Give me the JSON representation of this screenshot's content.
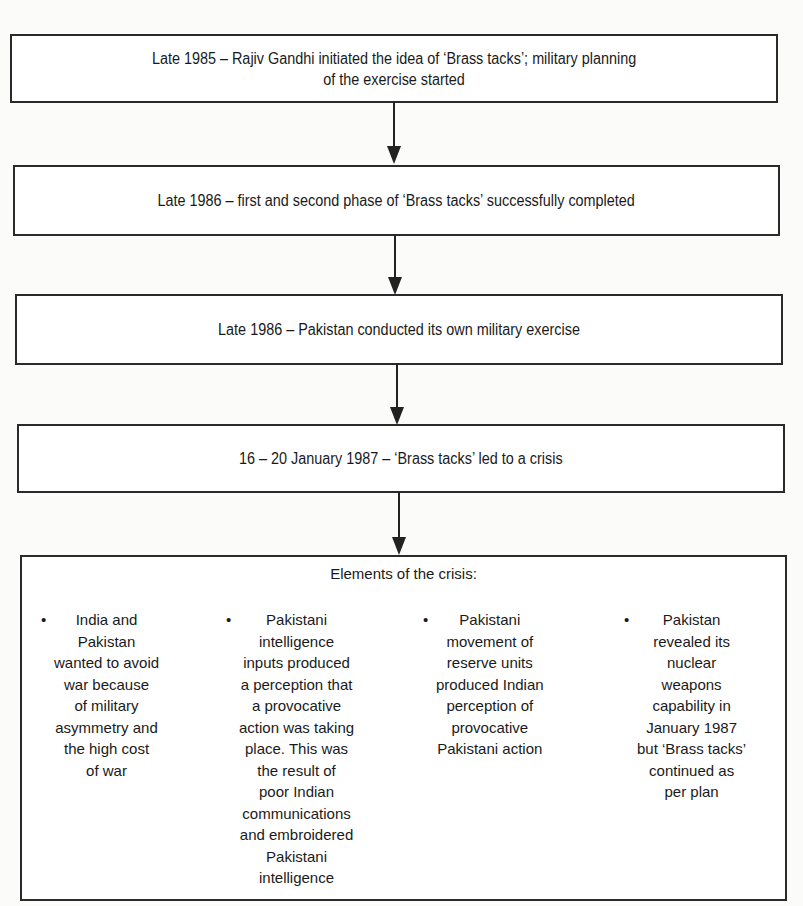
{
  "diagram": {
    "type": "flowchart",
    "steps": [
      {
        "id": "step1",
        "lines": [
          "Late 1985 – Rajiv Gandhi initiated the idea of ‘Brass tacks’; military planning",
          "of the exercise started"
        ]
      },
      {
        "id": "step2",
        "lines": [
          "Late 1986 – first and second phase of ‘Brass tacks’ successfully completed"
        ]
      },
      {
        "id": "step3",
        "lines": [
          "Late 1986 – Pakistan conducted its own military exercise"
        ]
      },
      {
        "id": "step4",
        "lines": [
          "16 – 20 January 1987 – ‘Brass tacks’ led to a crisis"
        ]
      }
    ],
    "crisis": {
      "title": "Elements of the crisis:",
      "bullet_glyph": "•",
      "columns": [
        {
          "lines": [
            "India and",
            "Pakistan",
            "wanted to avoid",
            "war because",
            "of military",
            "asymmetry and",
            "the high cost",
            "of war"
          ]
        },
        {
          "lines": [
            "Pakistani",
            "intelligence",
            "inputs produced",
            "a perception that",
            "a provocative",
            "action was taking",
            "place. This was",
            "the result of",
            "poor Indian",
            "communications",
            "and embroidered",
            "Pakistani",
            "intelligence"
          ]
        },
        {
          "lines": [
            "Pakistani",
            "movement of",
            "reserve units",
            "produced Indian",
            "perception of",
            "provocative",
            "Pakistani action"
          ]
        },
        {
          "lines": [
            "Pakistan",
            "revealed its",
            "nuclear",
            "weapons",
            "capability in",
            "January 1987",
            "but ‘Brass tacks’",
            "continued as",
            "per plan"
          ]
        }
      ]
    },
    "edges": [
      {
        "from": "step1",
        "to": "step2"
      },
      {
        "from": "step2",
        "to": "step3"
      },
      {
        "from": "step3",
        "to": "step4"
      },
      {
        "from": "step4",
        "to": "crisis"
      }
    ],
    "colors": {
      "border": "#2a2a2a",
      "text": "#1a1a1a",
      "background": "#fbfbf9"
    }
  }
}
